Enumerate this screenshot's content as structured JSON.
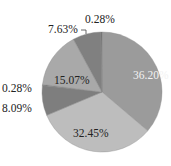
{
  "chart_data": {
    "type": "pie",
    "title": "",
    "start_angle_deg": 0,
    "direction": "clockwise",
    "slices": [
      {
        "label": "36.20%",
        "value": 36.2,
        "color": "#9b9b9b",
        "label_color": "#f2f2f2"
      },
      {
        "label": "32.45%",
        "value": 32.45,
        "color": "#bdbdbd",
        "label_color": "#222222"
      },
      {
        "label": "8.09%",
        "value": 8.09,
        "color": "#7e7e7e",
        "label_color": "#222222"
      },
      {
        "label": "0.28%",
        "value": 0.28,
        "color": "#6e6e6e",
        "label_color": "#222222"
      },
      {
        "label": "15.07%",
        "value": 15.07,
        "color": "#a9a9a9",
        "label_color": "#222222"
      },
      {
        "label": "7.63%",
        "value": 7.63,
        "color": "#808080",
        "label_color": "#222222"
      },
      {
        "label": "0.28%",
        "value": 0.28,
        "color": "#6a6a6a",
        "label_color": "#222222"
      }
    ],
    "values": [
      36.2,
      32.45,
      8.09,
      0.28,
      15.07,
      7.63,
      0.28
    ],
    "categories": [
      "36.20%",
      "32.45%",
      "8.09%",
      "0.28%",
      "15.07%",
      "7.63%",
      "0.28%"
    ],
    "legend": null
  },
  "layout": {
    "cx": 102,
    "cy": 92,
    "r": 60,
    "labels": [
      {
        "text": "36.20%",
        "x": 133,
        "y": 79,
        "color": "#f2f2f2"
      },
      {
        "text": "32.45%",
        "x": 73,
        "y": 137,
        "color": "#222222"
      },
      {
        "text": "8.09%",
        "x": 2,
        "y": 112,
        "color": "#222222"
      },
      {
        "text": "0.28%",
        "x": 2,
        "y": 92,
        "color": "#222222"
      },
      {
        "text": "15.07%",
        "x": 54,
        "y": 84,
        "color": "#222222"
      },
      {
        "text": "7.63%",
        "x": 48,
        "y": 33,
        "color": "#222222"
      },
      {
        "text": "0.28%",
        "x": 85,
        "y": 23,
        "color": "#222222"
      }
    ]
  }
}
